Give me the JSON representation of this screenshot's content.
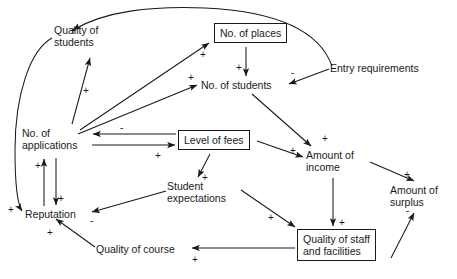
{
  "diagram": {
    "type": "causal-loop",
    "stroke_color": "#1a1a1a",
    "background_color": "#ffffff",
    "nodes": [
      {
        "id": "quality_students",
        "label": "Quality of\nstudents",
        "boxed": false,
        "x": 54,
        "y": 24,
        "w": 70,
        "h": 26
      },
      {
        "id": "no_places",
        "label": "No. of places",
        "boxed": true,
        "x": 214,
        "y": 23,
        "w": 79,
        "h": 22
      },
      {
        "id": "entry_requirements",
        "label": "Entry requirements",
        "boxed": false,
        "x": 330,
        "y": 62,
        "w": 105,
        "h": 13
      },
      {
        "id": "no_students",
        "label": "No. of students",
        "boxed": false,
        "x": 201,
        "y": 79,
        "w": 82,
        "h": 13
      },
      {
        "id": "no_applications",
        "label": "No. of\napplications",
        "boxed": false,
        "x": 22,
        "y": 127,
        "w": 66,
        "h": 26
      },
      {
        "id": "level_fees",
        "label": "Level of fees",
        "boxed": true,
        "x": 178,
        "y": 130,
        "w": 77,
        "h": 22
      },
      {
        "id": "amount_income",
        "label": "Amount of\nincome",
        "boxed": false,
        "x": 306,
        "y": 149,
        "w": 62,
        "h": 26
      },
      {
        "id": "amount_surplus",
        "label": "Amount of\nsurplus",
        "boxed": false,
        "x": 390,
        "y": 184,
        "w": 62,
        "h": 26
      },
      {
        "id": "student_expectations",
        "label": "Student\nexpectations",
        "boxed": false,
        "x": 167,
        "y": 180,
        "w": 72,
        "h": 26
      },
      {
        "id": "reputation",
        "label": "Reputation",
        "boxed": false,
        "x": 25,
        "y": 208,
        "w": 62,
        "h": 13
      },
      {
        "id": "quality_course",
        "label": "Quality of course",
        "boxed": false,
        "x": 96,
        "y": 243,
        "w": 92,
        "h": 13
      },
      {
        "id": "quality_staff",
        "label": "Quality of staff\nand facilities",
        "boxed": true,
        "x": 297,
        "y": 229,
        "w": 92,
        "h": 36
      }
    ],
    "links": [
      {
        "from": "entry_requirements",
        "to": "quality_students",
        "sign": "+",
        "sign_x": 70,
        "sign_y": 26
      },
      {
        "from": "no_applications",
        "to": "quality_students",
        "sign": "+",
        "sign_x": 83,
        "sign_y": 86
      },
      {
        "from": "no_applications",
        "to": "no_places",
        "sign": "+",
        "sign_x": 200,
        "sign_y": 50
      },
      {
        "from": "no_applications",
        "to": "no_students",
        "sign": "+",
        "sign_x": 188,
        "sign_y": 73
      },
      {
        "from": "no_places",
        "to": "no_students",
        "sign": "+",
        "sign_x": 236,
        "sign_y": 63
      },
      {
        "from": "entry_requirements",
        "to": "no_students",
        "sign": "-",
        "sign_x": 291,
        "sign_y": 68
      },
      {
        "from": "no_students",
        "to": "amount_income",
        "sign": "+",
        "sign_x": 322,
        "sign_y": 134
      },
      {
        "from": "level_fees",
        "to": "no_applications",
        "sign": "-",
        "sign_x": 120,
        "sign_y": 123
      },
      {
        "from": "no_applications",
        "to": "level_fees",
        "sign": "+",
        "sign_x": 155,
        "sign_y": 151
      },
      {
        "from": "level_fees",
        "to": "amount_income",
        "sign": "+",
        "sign_x": 290,
        "sign_y": 146
      },
      {
        "from": "level_fees",
        "to": "student_expectations",
        "sign": "+",
        "sign_x": 202,
        "sign_y": 173
      },
      {
        "from": "amount_income",
        "to": "amount_surplus",
        "sign": "+",
        "sign_x": 404,
        "sign_y": 170
      },
      {
        "from": "amount_income",
        "to": "quality_staff",
        "sign": "+",
        "sign_x": 339,
        "sign_y": 218
      },
      {
        "from": "quality_staff",
        "to": "amount_surplus",
        "sign": "-",
        "sign_x": 406,
        "sign_y": 206
      },
      {
        "from": "student_expectations",
        "to": "quality_staff",
        "sign": "+",
        "sign_x": 268,
        "sign_y": 213
      },
      {
        "from": "student_expectations",
        "to": "reputation",
        "sign": "-",
        "sign_x": 90,
        "sign_y": 216
      },
      {
        "from": "quality_staff",
        "to": "quality_course",
        "sign": "+",
        "sign_x": 192,
        "sign_y": 255
      },
      {
        "from": "quality_course",
        "to": "reputation",
        "sign": "+",
        "sign_x": 47,
        "sign_y": 228
      },
      {
        "from": "reputation",
        "to": "no_applications",
        "sign": "+",
        "sign_x": 35,
        "sign_y": 161
      },
      {
        "from": "no_applications",
        "to": "reputation",
        "sign": "+",
        "sign_x": 58,
        "sign_y": 194
      },
      {
        "from": "quality_students",
        "to": "reputation",
        "sign": "+",
        "sign_x": 8,
        "sign_y": 205
      }
    ]
  }
}
